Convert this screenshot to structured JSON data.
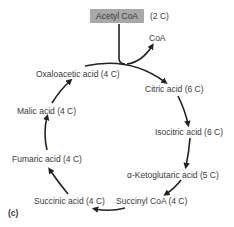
{
  "diagram": {
    "panel_label": "(c)",
    "input": {
      "name": "Acetyl CoA",
      "carbons": "(2 C)"
    },
    "released": "CoA",
    "cycle": [
      "Citric acid (6 C)",
      "Isocitric acid (6 C)",
      "α-Ketoglutaric acid (5 C)",
      "Succinyl CoA (4 C)",
      "Succinic acid (4 C)",
      "Fumaric acid (4 C)",
      "Malic acid (4 C)",
      "Oxaloacetic acid (4 C)"
    ],
    "colors": {
      "box": "#a8a8a8",
      "arrow": "#222222",
      "text": "#3a3a3a"
    }
  }
}
